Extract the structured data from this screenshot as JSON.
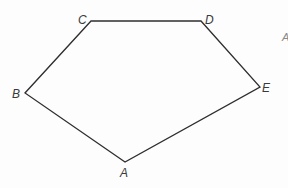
{
  "diagram": {
    "type": "pentagon",
    "stroke_color": "#2e2e2e",
    "label_color": "#3a3a3a",
    "vertices": [
      {
        "name": "A",
        "x": 125,
        "y": 162,
        "label_x": 120,
        "label_y": 177
      },
      {
        "name": "B",
        "x": 25,
        "y": 93,
        "label_x": 12,
        "label_y": 98
      },
      {
        "name": "C",
        "x": 91,
        "y": 21,
        "label_x": 78,
        "label_y": 24
      },
      {
        "name": "D",
        "x": 201,
        "y": 21,
        "label_x": 205,
        "label_y": 24
      },
      {
        "name": "E",
        "x": 260,
        "y": 87,
        "label_x": 262,
        "label_y": 92
      }
    ],
    "edges": [
      [
        "A",
        "B"
      ],
      [
        "B",
        "C"
      ],
      [
        "C",
        "D"
      ],
      [
        "D",
        "E"
      ],
      [
        "E",
        "A"
      ]
    ],
    "stray_mark": {
      "text": "A",
      "x": 282,
      "y": 41
    }
  }
}
